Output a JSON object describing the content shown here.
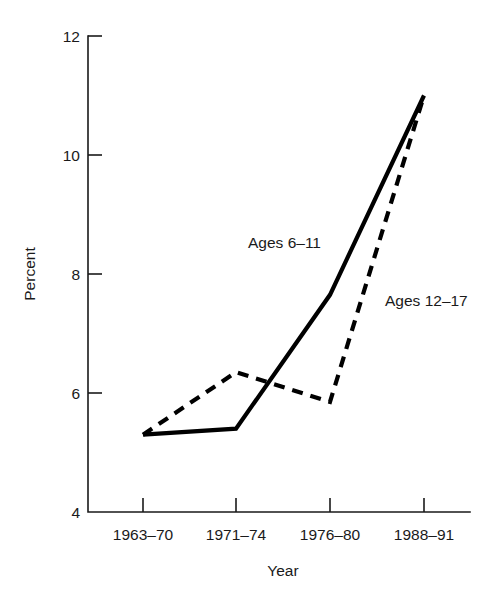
{
  "chart_data": {
    "type": "line",
    "title": "",
    "xlabel": "Year",
    "ylabel": "Percent",
    "categories": [
      "1963–70",
      "1971–74",
      "1976–80",
      "1988–91"
    ],
    "ylim": [
      4,
      12
    ],
    "yticks": [
      4,
      6,
      8,
      10,
      12
    ],
    "ytick_labels": [
      "4",
      "6",
      "8",
      "10",
      "12"
    ],
    "grid": false,
    "legend_position": "inline-annotations",
    "series": [
      {
        "name": "Ages 6–11",
        "style": "solid",
        "color": "#000000",
        "values": [
          5.3,
          5.4,
          7.65,
          11.0
        ]
      },
      {
        "name": "Ages 12–17",
        "style": "dashed",
        "color": "#000000",
        "values": [
          5.3,
          6.35,
          5.85,
          11.0
        ]
      }
    ],
    "annotations": [
      {
        "text": "Ages 6–11",
        "series": "Ages 6–11"
      },
      {
        "text": "Ages 12–17",
        "series": "Ages 12–17"
      }
    ]
  },
  "axes": {
    "y_title": "Percent",
    "x_title": "Year",
    "y_tick_0": "4",
    "y_tick_1": "6",
    "y_tick_2": "8",
    "y_tick_3": "10",
    "y_tick_4": "12",
    "x_tick_0": "1963–70",
    "x_tick_1": "1971–74",
    "x_tick_2": "1976–80",
    "x_tick_3": "1988–91"
  },
  "annotations": {
    "ages_6_11": "Ages 6–11",
    "ages_12_17": "Ages 12–17"
  }
}
